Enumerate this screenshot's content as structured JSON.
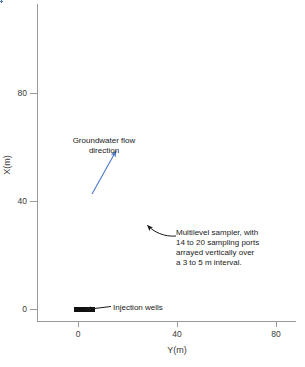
{
  "figure": {
    "axes": {
      "xlabel": "Y(m)",
      "ylabel": "X(m)",
      "xticks": [
        "0",
        "40",
        "80"
      ],
      "yticks": [
        "0",
        "40",
        "80"
      ]
    },
    "annotations": {
      "flow": "Groundwater flow\ndirection",
      "flow_line1": "Groundwater flow",
      "flow_line2": "direction",
      "sampler": "Multilevel sampler, with 14 to 20 sampling ports arrayed vertically over a 3 to 5 m interval.",
      "sampler_line1": "Multilevel sampler, with",
      "sampler_line2": "14 to 20 sampling ports",
      "sampler_line3": "arrayed vertically over",
      "sampler_line4": "a 3 to 5 m interval.",
      "injection": "Injection wells"
    },
    "colors": {
      "sampler_marker": "#4a78c8",
      "injection_marker": "#111111",
      "flow_arrow": "#4a78c8",
      "leader_line": "#1a1a1a",
      "axis": "#9a9a9a",
      "text": "#1a1a1a"
    }
  },
  "chart_data": {
    "type": "scatter",
    "title": "",
    "xlabel": "Y(m)",
    "ylabel": "X(m)",
    "xlim": [
      -12,
      82
    ],
    "ylim": [
      -6,
      112
    ],
    "xticks": [
      0,
      40,
      80
    ],
    "yticks": [
      0,
      40,
      80
    ],
    "grid": false,
    "legend": null,
    "series": [
      {
        "name": "Multilevel samplers",
        "marker": "plus",
        "color": "#4a78c8",
        "note": "Dense near-source grid, a central block, and sparse downgradient transect rows",
        "groups": [
          {
            "name": "near-source dense grid",
            "comment": "Close-spaced samplers surrounding the injection wells, x from about -5 to 12 m, y from about -4 to 14 m",
            "x_range": [
              -5,
              12
            ],
            "y_range": [
              -4,
              14
            ],
            "spacing_m": 1.0
          },
          {
            "name": "near-field fan",
            "comment": "Spreading block downgradient of source, x about -3 to 20, y about 8 to 34",
            "x_range": [
              -3,
              20
            ],
            "y_range": [
              8,
              34
            ],
            "spacing_m": 2.0
          },
          {
            "name": "central dense block",
            "comment": "Main sampling grid, x about 8 to 33, y about 34 to 62",
            "x_range": [
              8,
              33
            ],
            "y_range": [
              34,
              62
            ],
            "spacing_m": 2.0
          },
          {
            "name": "downgradient transects",
            "comment": "Seven widely spaced rows of samplers, y about 70 to 108",
            "rows": [
              {
                "y": 70,
                "x_start": 27,
                "x_end": 47,
                "spacing_m": 2.5
              },
              {
                "y": 78,
                "x_start": 26,
                "x_end": 60,
                "spacing_m": 2.5
              },
              {
                "y": 84,
                "x_start": 29,
                "x_end": 70,
                "spacing_m": 2.5
              },
              {
                "y": 91,
                "x_start": 31,
                "x_end": 45,
                "spacing_m": 2.5
              },
              {
                "y": 96,
                "x_start": 31,
                "x_end": 45,
                "spacing_m": 2.5
              },
              {
                "y": 103,
                "x_start": 33,
                "x_end": 44,
                "spacing_m": 2.5
              },
              {
                "y": 109,
                "x_start": 38,
                "x_end": 46,
                "spacing_m": 2.5
              }
            ]
          }
        ]
      },
      {
        "name": "Injection wells",
        "marker": "square",
        "color": "#111111",
        "comment": "Row of closely spaced injection wells at about x = 0 m",
        "x_range": [
          -1,
          6
        ],
        "y_range": [
          -1,
          1
        ],
        "count": 14
      }
    ],
    "arrows": [
      {
        "name": "groundwater-flow-arrow",
        "color": "#4a78c8",
        "label": "Groundwater flow direction",
        "from_px": [
          92,
          194
        ],
        "to_px": [
          117,
          150
        ]
      },
      {
        "name": "sampler-leader",
        "color": "#1a1a1a",
        "label": "Multilevel sampler",
        "from_px": [
          176,
          235
        ],
        "to_px": [
          146,
          224
        ]
      },
      {
        "name": "injection-leader",
        "color": "#1a1a1a",
        "label": "Injection wells",
        "from_px": [
          110,
          307
        ],
        "to_px": [
          82,
          310
        ]
      }
    ]
  }
}
